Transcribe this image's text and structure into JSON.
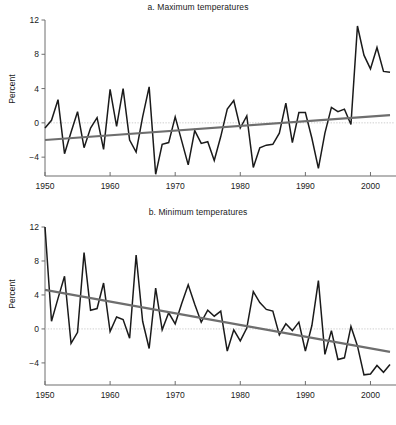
{
  "figure": {
    "axis_label": "Percent",
    "colors": {
      "data_line": "#1a1a1a",
      "trend_line": "#6e6e6e",
      "zero_line": "#cfcfcf",
      "axis": "#6e6e6e",
      "background": "#ffffff"
    }
  },
  "chart_data": [
    {
      "type": "line",
      "panel": "a",
      "title": "a.  Maximum temperatures",
      "xlabel": "",
      "ylabel": "Percent",
      "xlim": [
        1950,
        2003
      ],
      "ylim": [
        -6.2,
        12
      ],
      "yticks": [
        12,
        8,
        4,
        0,
        -4
      ],
      "ytick_labels": [
        "12",
        "8",
        "4",
        "0",
        "−4"
      ],
      "xticks": [
        1950,
        1960,
        1970,
        1980,
        1990,
        2000
      ],
      "xtick_labels": [
        "1950",
        "1960",
        "1970",
        "1980",
        "1990",
        "2000"
      ],
      "grid": false,
      "legend": "none",
      "zero_reference_line": 0,
      "series": [
        {
          "name": "Maximum temperatures",
          "style": "observed",
          "x": [
            1950,
            1951,
            1952,
            1953,
            1954,
            1955,
            1956,
            1957,
            1958,
            1959,
            1960,
            1961,
            1962,
            1963,
            1964,
            1965,
            1966,
            1967,
            1968,
            1969,
            1970,
            1971,
            1972,
            1973,
            1974,
            1975,
            1976,
            1977,
            1978,
            1979,
            1980,
            1981,
            1982,
            1983,
            1984,
            1985,
            1986,
            1987,
            1988,
            1989,
            1990,
            1991,
            1992,
            1993,
            1994,
            1995,
            1996,
            1997,
            1998,
            1999,
            2000,
            2001,
            2002,
            2003
          ],
          "values": [
            -0.6,
            0.3,
            2.7,
            -3.6,
            -1.1,
            1.3,
            -2.9,
            -0.6,
            0.6,
            -3.1,
            3.9,
            -0.4,
            4.0,
            -2.0,
            -3.4,
            0.7,
            4.2,
            -6.0,
            -2.5,
            -2.3,
            0.7,
            -2.1,
            -4.9,
            -0.9,
            -2.4,
            -2.2,
            -4.4,
            -1.6,
            1.6,
            2.6,
            -0.6,
            0.8,
            -5.2,
            -2.9,
            -2.6,
            -2.5,
            -1.2,
            2.3,
            -2.3,
            1.2,
            1.2,
            -1.8,
            -5.3,
            -1.2,
            1.8,
            1.3,
            1.6,
            -0.2,
            11.3,
            7.9,
            6.3,
            8.8,
            6.0,
            5.9
          ]
        },
        {
          "name": "Linear trend",
          "style": "trend",
          "x": [
            1950,
            2003
          ],
          "values": [
            -2.0,
            0.9
          ]
        }
      ]
    },
    {
      "type": "line",
      "panel": "b",
      "title": "b.  Minimum temperatures",
      "xlabel": "",
      "ylabel": "Percent",
      "xlim": [
        1950,
        2003
      ],
      "ylim": [
        -6.6,
        12
      ],
      "yticks": [
        12,
        8,
        4,
        0,
        -4
      ],
      "ytick_labels": [
        "12",
        "8",
        "4",
        "0",
        "−4"
      ],
      "xticks": [
        1950,
        1960,
        1970,
        1980,
        1990,
        2000
      ],
      "xtick_labels": [
        "1950",
        "1960",
        "1970",
        "1980",
        "1990",
        "2000"
      ],
      "grid": false,
      "legend": "none",
      "zero_reference_line": 0,
      "series": [
        {
          "name": "Minimum temperatures",
          "style": "observed",
          "x": [
            1950,
            1951,
            1952,
            1953,
            1954,
            1955,
            1956,
            1957,
            1958,
            1959,
            1960,
            1961,
            1962,
            1963,
            1964,
            1965,
            1966,
            1967,
            1968,
            1969,
            1970,
            1971,
            1972,
            1973,
            1974,
            1975,
            1976,
            1977,
            1978,
            1979,
            1980,
            1981,
            1982,
            1983,
            1984,
            1985,
            1986,
            1987,
            1988,
            1989,
            1990,
            1991,
            1992,
            1993,
            1994,
            1995,
            1996,
            1997,
            1998,
            1999,
            2000,
            2001,
            2002,
            2003
          ],
          "values": [
            12.0,
            0.9,
            3.6,
            6.2,
            -1.7,
            -0.4,
            9.0,
            2.2,
            2.4,
            5.4,
            -0.3,
            1.4,
            1.1,
            -1.1,
            8.7,
            0.9,
            -2.3,
            4.8,
            -0.1,
            1.9,
            0.6,
            3.0,
            5.2,
            2.9,
            0.8,
            2.2,
            1.5,
            2.1,
            -2.6,
            -0.1,
            -1.4,
            0.1,
            4.4,
            3.1,
            2.3,
            2.1,
            -0.7,
            0.6,
            -0.2,
            0.8,
            -2.6,
            0.4,
            5.7,
            -3.0,
            -0.2,
            -3.6,
            -3.4,
            0.3,
            -2.0,
            -5.4,
            -5.3,
            -4.3,
            -5.1,
            -4.2
          ]
        },
        {
          "name": "Linear trend",
          "style": "trend",
          "x": [
            1950,
            2003
          ],
          "values": [
            4.6,
            -2.7
          ]
        }
      ]
    }
  ]
}
